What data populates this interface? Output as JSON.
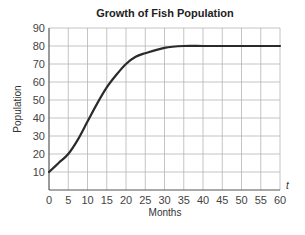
{
  "chart_data": {
    "type": "line",
    "title": "Growth of Fish Population",
    "xlabel": "Months",
    "ylabel": "Population",
    "x_axis_variable": "t",
    "xlim": [
      0,
      60
    ],
    "ylim": [
      0,
      90
    ],
    "x_ticks": [
      0,
      5,
      10,
      15,
      20,
      25,
      30,
      35,
      40,
      45,
      50,
      55,
      60
    ],
    "y_ticks": [
      10,
      20,
      30,
      40,
      50,
      60,
      70,
      80,
      90
    ],
    "grid": true,
    "legend": null,
    "series": [
      {
        "name": "Fish population",
        "x": [
          0,
          2.5,
          5,
          7.5,
          10,
          12.5,
          15,
          17.5,
          20,
          22.5,
          25,
          30,
          35,
          40,
          45,
          50,
          55,
          60
        ],
        "values": [
          10,
          15,
          20,
          28,
          38,
          48,
          57,
          64,
          70,
          74,
          76,
          79,
          80,
          80,
          80,
          80,
          80,
          80
        ]
      }
    ]
  }
}
